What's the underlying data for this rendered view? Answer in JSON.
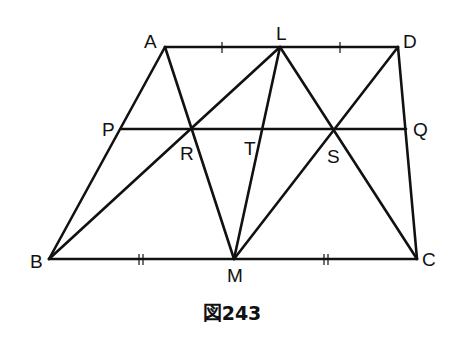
{
  "diagram": {
    "caption": "図243",
    "points": {
      "A": {
        "label": "A",
        "x": 165,
        "y": 47
      },
      "L": {
        "label": "L",
        "x": 280,
        "y": 47
      },
      "D": {
        "label": "D",
        "x": 398,
        "y": 47
      },
      "B": {
        "label": "B",
        "x": 49,
        "y": 259
      },
      "M": {
        "label": "M",
        "x": 234,
        "y": 259
      },
      "C": {
        "label": "C",
        "x": 417,
        "y": 259
      },
      "P": {
        "label": "P",
        "x": 121,
        "y": 129
      },
      "Q": {
        "label": "Q",
        "x": 406,
        "y": 129
      },
      "R": {
        "label": "R",
        "x": 190,
        "y": 129
      },
      "T": {
        "label": "T",
        "x": 262,
        "y": 129
      },
      "S": {
        "label": "S",
        "x": 334,
        "y": 129
      }
    },
    "segments": [
      "AD",
      "BC",
      "AB",
      "DC",
      "PQ",
      "AM",
      "LB",
      "LM",
      "LC",
      "DM"
    ],
    "equal_marks": {
      "single": [
        "AL",
        "LD"
      ],
      "double": [
        "BM",
        "MC"
      ]
    },
    "colors": {
      "line": "#111111",
      "background": "#ffffff"
    }
  }
}
